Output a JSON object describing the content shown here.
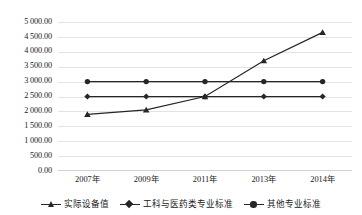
{
  "chart_data": {
    "type": "line",
    "title": "",
    "subtitle": "",
    "xlabel": "",
    "ylabel": "",
    "categories": [
      "2007年",
      "2009年",
      "2011年",
      "2013年",
      "2014年"
    ],
    "ylim": [
      0,
      5000
    ],
    "ytick_step": 500,
    "ytick_labels": [
      "5 000.00",
      "4 500.00",
      "4 000.00",
      "3 500.00",
      "3 000.00",
      "2 500.00",
      "2 000.00",
      "1 500.00",
      "1 000.00",
      "500.00",
      "0.00"
    ],
    "ytick_values": [
      5000,
      4500,
      4000,
      3500,
      3000,
      2500,
      2000,
      1500,
      1000,
      500,
      0
    ],
    "grid": true,
    "legend_position": "bottom",
    "series": [
      {
        "name": "实际设备值",
        "marker": "triangle",
        "color": "#262626",
        "values": [
          1900,
          2050,
          2500,
          3700,
          4650
        ]
      },
      {
        "name": "工科与医药类专业标准",
        "marker": "diamond",
        "color": "#262626",
        "values": [
          2500,
          2500,
          2500,
          2500,
          2500
        ]
      },
      {
        "name": "其他专业标准",
        "marker": "circle",
        "color": "#262626",
        "values": [
          3000,
          3000,
          3000,
          3000,
          3000
        ]
      }
    ]
  },
  "legend": {
    "entries": [
      {
        "label": "实际设备值",
        "marker": "triangle-marker-icon"
      },
      {
        "label": "工科与医药类专业标准",
        "marker": "diamond-marker-icon"
      },
      {
        "label": "其他专业标准",
        "marker": "circle-marker-icon"
      }
    ]
  },
  "style": {
    "series_color": "#262626",
    "gridline_color": "#e3e3e3",
    "axis_color": "#d0d0d0",
    "background": "#ffffff"
  }
}
